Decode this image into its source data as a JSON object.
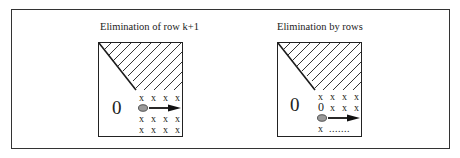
{
  "diagram": {
    "panels": [
      {
        "title": "Elimination of row k+1",
        "zero_label": "0",
        "rows": [
          [
            "x",
            "x",
            "x",
            "x"
          ],
          [
            "pivot",
            "arrow"
          ],
          [
            "x",
            "x",
            "x",
            "x"
          ],
          [
            "x",
            "x",
            "x",
            "x"
          ]
        ]
      },
      {
        "title": "Elimination by rows",
        "zero_label": "0",
        "rows": [
          [
            "x",
            "x",
            "x",
            "x"
          ],
          [
            "0",
            "x",
            "x",
            "x"
          ],
          [
            "pivot",
            "arrow"
          ],
          [
            "x",
            "......."
          ]
        ]
      }
    ],
    "cell_glyph": "x",
    "inner_zero": "0",
    "dots": ".......",
    "colors": {
      "stroke": "#222222",
      "hatch": "#333333",
      "pivot_fill": "#9a9a9a",
      "background": "#ffffff"
    }
  }
}
